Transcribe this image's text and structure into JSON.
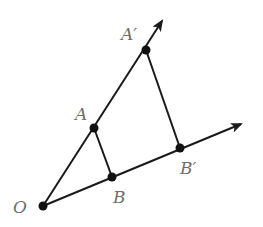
{
  "diagram": {
    "type": "geometry-similar-triangles",
    "colors": {
      "line": "#1a1a1a",
      "point": "#111111",
      "label": "#6e6e6e",
      "background": "#ffffff"
    },
    "points": [
      {
        "id": "O",
        "label": "O",
        "x": 43,
        "y": 206
      },
      {
        "id": "A",
        "label": "A",
        "x": 94,
        "y": 128
      },
      {
        "id": "B",
        "label": "B",
        "x": 112,
        "y": 177
      },
      {
        "id": "A_prime",
        "label": "A′",
        "x": 146,
        "y": 50
      },
      {
        "id": "B_prime",
        "label": "B′",
        "x": 180,
        "y": 148
      }
    ],
    "rays": [
      {
        "from": "O",
        "through": "A_prime",
        "tip": [
          163,
          19
        ]
      },
      {
        "from": "O",
        "through": "B_prime",
        "tip": [
          243,
          123
        ]
      }
    ],
    "segments": [
      {
        "from": "A",
        "to": "B"
      },
      {
        "from": "A_prime",
        "to": "B_prime"
      }
    ],
    "labels": {
      "O": "O",
      "A": "A",
      "B": "B",
      "A_prime": "A′",
      "B_prime": "B′"
    }
  }
}
